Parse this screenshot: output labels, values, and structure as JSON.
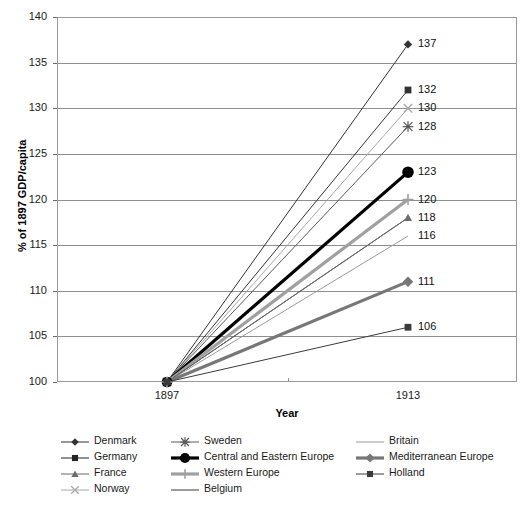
{
  "chart_data": {
    "type": "line",
    "title": "",
    "xlabel": "Year",
    "ylabel": "% of 1897 GDP/capita",
    "x": [
      "1897",
      "1913"
    ],
    "xtick_labels": [
      "1897",
      "1913"
    ],
    "ytick_labels": [
      "100",
      "105",
      "110",
      "115",
      "120",
      "125",
      "130",
      "135",
      "140"
    ],
    "ylim": [
      100,
      140
    ],
    "grid": "horizontal",
    "legend_position": "bottom",
    "series": [
      {
        "name": "Denmark",
        "values": [
          100,
          137
        ],
        "end_label": "137",
        "color": "#333333",
        "width": 1,
        "marker": "diamond"
      },
      {
        "name": "Germany",
        "values": [
          100,
          132
        ],
        "end_label": "132",
        "color": "#333333",
        "width": 1,
        "marker": "square"
      },
      {
        "name": "Norway",
        "values": [
          100,
          130
        ],
        "end_label": "130",
        "color": "#a8a8a8",
        "width": 1,
        "marker": "xcross"
      },
      {
        "name": "Sweden",
        "values": [
          100,
          128
        ],
        "end_label": "128",
        "color": "#5a5a5a",
        "width": 1,
        "marker": "star"
      },
      {
        "name": "Central and Eastern Europe",
        "values": [
          100,
          123
        ],
        "end_label": "123",
        "color": "#000000",
        "width": 3.2,
        "marker": "circle"
      },
      {
        "name": "Western Europe",
        "values": [
          100,
          120
        ],
        "end_label": "120",
        "color": "#a0a0a0",
        "width": 3.2,
        "marker": "plus"
      },
      {
        "name": "Belgium",
        "values": [
          100,
          118
        ],
        "end_label": "118",
        "color": "#3b3b3b",
        "width": 1,
        "marker": "none"
      },
      {
        "name": "Britain",
        "values": [
          100,
          116
        ],
        "end_label": "116",
        "color": "#9a9a9a",
        "width": 1,
        "marker": "none"
      },
      {
        "name": "France",
        "values": [
          100,
          118
        ],
        "end_label": "",
        "color": "#6b6b6b",
        "width": 1,
        "marker": "triangle"
      },
      {
        "name": "Mediterranean Europe",
        "values": [
          100,
          111
        ],
        "end_label": "111",
        "color": "#777777",
        "width": 3.2,
        "marker": "diamond"
      },
      {
        "name": "Holland",
        "values": [
          100,
          106
        ],
        "end_label": "106",
        "color": "#3b3b3b",
        "width": 1,
        "marker": "square"
      }
    ],
    "legend": [
      {
        "label": "Denmark",
        "color": "#333333",
        "width": 1,
        "marker": "diamond",
        "col": 0,
        "row": 0
      },
      {
        "label": "Germany",
        "color": "#222222",
        "width": 1,
        "marker": "square",
        "col": 0,
        "row": 1
      },
      {
        "label": "France",
        "color": "#6b6b6b",
        "width": 1,
        "marker": "triangle",
        "col": 0,
        "row": 2
      },
      {
        "label": "Norway",
        "color": "#a8a8a8",
        "width": 1,
        "marker": "xcross",
        "col": 0,
        "row": 3
      },
      {
        "label": "Sweden",
        "color": "#5a5a5a",
        "width": 1,
        "marker": "star",
        "col": 1,
        "row": 0
      },
      {
        "label": "Central and Eastern Europe",
        "color": "#000000",
        "width": 3.2,
        "marker": "circle",
        "col": 1,
        "row": 1
      },
      {
        "label": "Western Europe",
        "color": "#a0a0a0",
        "width": 3.2,
        "marker": "plus",
        "col": 1,
        "row": 2
      },
      {
        "label": "Belgium",
        "color": "#3b3b3b",
        "width": 1,
        "marker": "none",
        "col": 1,
        "row": 3
      },
      {
        "label": "Britain",
        "color": "#9a9a9a",
        "width": 1,
        "marker": "none",
        "col": 2,
        "row": 0
      },
      {
        "label": "Mediterranean Europe",
        "color": "#777777",
        "width": 3.2,
        "marker": "diamond",
        "col": 2,
        "row": 1
      },
      {
        "label": "Holland",
        "color": "#3b3b3b",
        "width": 1,
        "marker": "square",
        "col": 2,
        "row": 2
      }
    ]
  }
}
